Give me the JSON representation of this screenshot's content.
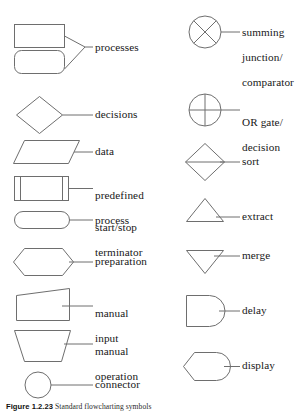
{
  "figure": {
    "caption_number": "Figure 1.2.23",
    "caption_text": "Standard flowcharting symbols",
    "stroke_color": "#6e6e6e",
    "text_color": "#171717",
    "background": "#ffffff"
  },
  "columns": {
    "left": {
      "name": "left-symbol-column",
      "entries": [
        {
          "id": "processes",
          "icon": "process-rectangle-and-rounded-rectangle",
          "label": "processes",
          "label_lines": [
            "processes"
          ]
        },
        {
          "id": "decisions",
          "icon": "decision-diamond",
          "label": "decisions",
          "label_lines": [
            "decisions"
          ]
        },
        {
          "id": "data",
          "icon": "data-parallelogram",
          "label": "data",
          "label_lines": [
            "data"
          ]
        },
        {
          "id": "predefined-process",
          "icon": "predefined-process-rectangle",
          "label": "predefined process",
          "label_lines": [
            "predefined",
            "process"
          ]
        },
        {
          "id": "start-stop-terminator",
          "icon": "terminator-stadium",
          "label": "start/stop terminator",
          "label_lines": [
            "start/stop",
            "terminator"
          ]
        },
        {
          "id": "preparation",
          "icon": "preparation-hexagon",
          "label": "preparation",
          "label_lines": [
            "preparation"
          ]
        },
        {
          "id": "manual-input",
          "icon": "manual-input-slanted-top",
          "label": "manual input",
          "label_lines": [
            "manual",
            "input"
          ]
        },
        {
          "id": "manual-operation",
          "icon": "manual-operation-trapezoid",
          "label": "manual operation",
          "label_lines": [
            "manual",
            "operation"
          ]
        },
        {
          "id": "connector",
          "icon": "connector-circle",
          "label": "connector",
          "label_lines": [
            "connector"
          ]
        }
      ]
    },
    "right": {
      "name": "right-symbol-column",
      "entries": [
        {
          "id": "summing-junction",
          "icon": "summing-junction-circle-with-cross",
          "label": "summing junction/ comparator",
          "label_lines": [
            "summing",
            "junction/",
            "comparator"
          ]
        },
        {
          "id": "or-gate",
          "icon": "or-gate-circle-with-plus",
          "label": "OR gate/ decision",
          "label_lines": [
            "OR gate/",
            "decision"
          ]
        },
        {
          "id": "sort",
          "icon": "sort-diamond-with-midline",
          "label": "sort",
          "label_lines": [
            "sort"
          ]
        },
        {
          "id": "extract",
          "icon": "extract-triangle-up",
          "label": "extract",
          "label_lines": [
            "extract"
          ]
        },
        {
          "id": "merge",
          "icon": "merge-triangle-down",
          "label": "merge",
          "label_lines": [
            "merge"
          ]
        },
        {
          "id": "delay",
          "icon": "delay-rounded-right-end",
          "label": "delay",
          "label_lines": [
            "delay"
          ]
        },
        {
          "id": "display",
          "icon": "display-curved-left-rounded-right",
          "label": "display",
          "label_lines": [
            "display"
          ]
        }
      ]
    }
  }
}
